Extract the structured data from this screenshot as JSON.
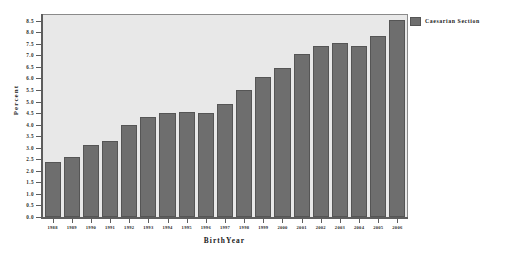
{
  "legend": {
    "position": "right",
    "entries": [
      {
        "label": "Caesarian Section",
        "color": "#6e6e6e"
      }
    ]
  },
  "axes": {
    "y_title": "Percent",
    "x_title": "BirthYear",
    "y_ticks": [
      "0.0",
      "0.5",
      "1.0",
      "1.5",
      "2.0",
      "2.5",
      "3.0",
      "3.5",
      "4.0",
      "4.5",
      "5.0",
      "5.5",
      "6.0",
      "6.5",
      "7.0",
      "7.5",
      "8.0",
      "8.5"
    ]
  },
  "chart_data": {
    "type": "bar",
    "title": "",
    "subtitle": "",
    "xlabel": "BirthYear",
    "ylabel": "Percent",
    "ylim": [
      0.0,
      8.75
    ],
    "ytick_step": 0.5,
    "grid": false,
    "legend_position": "right",
    "bar_color": "#6e6e6e",
    "plot_background": "#e8e8e8",
    "categories": [
      "1988",
      "1989",
      "1990",
      "1991",
      "1992",
      "1993",
      "1994",
      "1995",
      "1996",
      "1997",
      "1998",
      "1999",
      "2000",
      "2001",
      "2002",
      "2003",
      "2004",
      "2005",
      "2006"
    ],
    "series": [
      {
        "name": "Caesarian Section",
        "values": [
          2.4,
          2.6,
          3.1,
          3.3,
          4.0,
          4.35,
          4.5,
          4.55,
          4.5,
          4.9,
          5.5,
          6.05,
          6.45,
          7.05,
          7.4,
          7.55,
          7.4,
          7.85,
          8.55
        ]
      }
    ]
  }
}
